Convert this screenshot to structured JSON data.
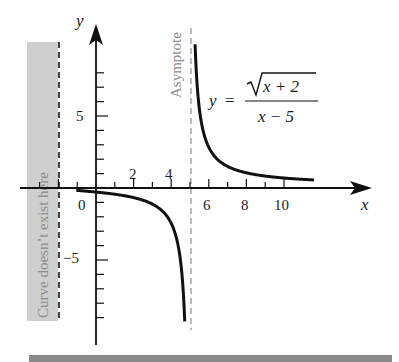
{
  "chart_data": {
    "type": "line",
    "title": "",
    "function": "y = sqrt(x + 2) / (x - 5)",
    "formula_label": {
      "lhs": "y",
      "equals": "=",
      "numerator": "x + 2",
      "numerator_has_sqrt": true,
      "denominator": "x − 5"
    },
    "xlabel": "x",
    "ylabel": "y",
    "xlim": [
      -3.3,
      14.5
    ],
    "ylim": [
      -10.9,
      11.4
    ],
    "grid": false,
    "x_ticks": [
      -3,
      -2,
      -1,
      1,
      2,
      3,
      4,
      5,
      6,
      7,
      8,
      9,
      10
    ],
    "x_tick_labels": [
      {
        "value": 0,
        "text": "0",
        "position": "below-left"
      },
      {
        "value": 2,
        "text": "2",
        "position": "above"
      },
      {
        "value": 4,
        "text": "4",
        "position": "above"
      },
      {
        "value": 6,
        "text": "6",
        "position": "below"
      },
      {
        "value": 8,
        "text": "8",
        "position": "below"
      },
      {
        "value": 10,
        "text": "10",
        "position": "below"
      }
    ],
    "y_ticks": [
      -9,
      -8,
      -7,
      -6,
      -5,
      -4,
      -3,
      -2,
      -1,
      1,
      2,
      3,
      4,
      5,
      6,
      7,
      8
    ],
    "y_tick_labels": [
      {
        "value": 5,
        "text": "5"
      },
      {
        "value": -5,
        "text": "−5"
      }
    ],
    "series": [
      {
        "name": "left branch",
        "x": [
          -1,
          0,
          1,
          2,
          3,
          3.5,
          4,
          4.3,
          4.5,
          4.6,
          4.7,
          4.72
        ],
        "y": [
          -0.17,
          -0.28,
          -0.43,
          -0.66,
          -1.12,
          -1.53,
          -2.45,
          -3.69,
          -5.1,
          -6.49,
          -8.77,
          -9.3
        ]
      },
      {
        "name": "right branch",
        "x": [
          5.27,
          5.3,
          5.4,
          5.5,
          5.7,
          6,
          6.5,
          7,
          8,
          9,
          10,
          11,
          11.6
        ],
        "y": [
          9.6,
          8.77,
          6.78,
          5.48,
          3.99,
          2.83,
          2.01,
          1.58,
          1.15,
          0.94,
          0.82,
          0.72,
          0.67
        ]
      }
    ],
    "annotations": [
      {
        "type": "vertical-asymptote",
        "x": 5,
        "label": "Asymptote",
        "style": "dashed"
      },
      {
        "type": "excluded-region",
        "x_max": -2,
        "label": "Curve doesn’t exist here",
        "style": "gray-shaded",
        "boundary": "dashed"
      }
    ]
  },
  "labels": {
    "asymptote": "Asymptote",
    "excluded_region": "Curve doesn’t exist here",
    "x_axis": "x",
    "y_axis": "y",
    "origin": "0",
    "tick_2": "2",
    "tick_4": "4",
    "tick_6": "6",
    "tick_8": "8",
    "tick_10": "10",
    "tick_y5": "5",
    "tick_yneg5": "−5",
    "formula_lhs": "y",
    "formula_eq": "=",
    "formula_num": "x + 2",
    "formula_den": "x − 5"
  },
  "colors": {
    "curve": "#111111",
    "axis": "#111111",
    "asymptote": "#8c8c8c",
    "excluded_fill": "#cfcfcf",
    "bottom_bar": "#8a8a8a"
  }
}
